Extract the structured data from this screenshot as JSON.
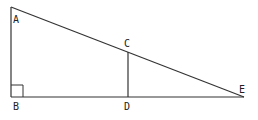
{
  "diagram": {
    "type": "geometry",
    "labels": {
      "A": "A",
      "B": "B",
      "C": "C",
      "D": "D",
      "E": "E"
    },
    "points": {
      "A": [
        11,
        7
      ],
      "B": [
        11,
        97
      ],
      "C": [
        128,
        52
      ],
      "D": [
        128,
        97
      ],
      "E": [
        244,
        97
      ]
    },
    "segments": [
      [
        "A",
        "B"
      ],
      [
        "B",
        "E"
      ],
      [
        "A",
        "E"
      ],
      [
        "C",
        "D"
      ]
    ],
    "right_angle_at": "B",
    "line_color": "#333333"
  }
}
